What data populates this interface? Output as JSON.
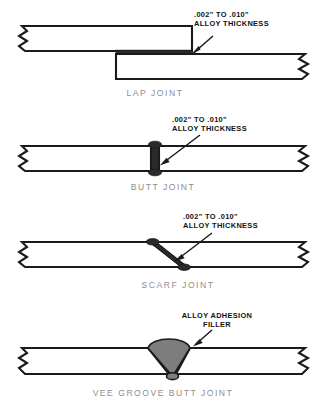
{
  "diagram": {
    "background_color": "#ffffff",
    "line_color": "#1b1b1b",
    "caption_color": "#8e8e8e",
    "alloy_dark_color": "#2a2a2a",
    "alloy_fill_color": "#7d7d7d",
    "annotation_thickness_line1": ".002\" TO .010\"",
    "annotation_thickness_line2": "ALLOY THICKNESS",
    "annotation_filler_line1": "ALLOY ADHESION",
    "annotation_filler_line2": "FILLER"
  },
  "figures": [
    {
      "id": "lap-joint",
      "caption": "LAP JOINT",
      "annotation_line1": ".002\" TO .010\"",
      "annotation_line2": "ALLOY THICKNESS"
    },
    {
      "id": "butt-joint",
      "caption": "BUTT JOINT",
      "annotation_line1": ".002\" TO .010\"",
      "annotation_line2": "ALLOY THICKNESS"
    },
    {
      "id": "scarf-joint",
      "caption": "SCARF JOINT",
      "annotation_line1": ".002\" TO .010\"",
      "annotation_line2": "ALLOY THICKNESS"
    },
    {
      "id": "vee-groove-butt-joint",
      "caption": "VEE GROOVE BUTT JOINT",
      "annotation_line1": "ALLOY ADHESION",
      "annotation_line2": "FILLER"
    }
  ]
}
